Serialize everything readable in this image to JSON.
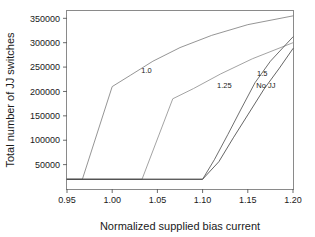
{
  "chart_data": {
    "type": "line",
    "title": "",
    "xlabel": "Normalized supplied bias current",
    "ylabel": "Total number of JJ switches",
    "xlim": [
      0.95,
      1.2
    ],
    "ylim": [
      0,
      365000
    ],
    "xticks": [
      "0.95",
      "1.00",
      "1.05",
      "1.10",
      "1.15",
      "1.20"
    ],
    "xtick_values": [
      0.95,
      1.0,
      1.05,
      1.1,
      1.15,
      1.2
    ],
    "yticks": [
      "50000",
      "100000",
      "150000",
      "200000",
      "250000",
      "300000",
      "350000"
    ],
    "ytick_values": [
      50000,
      100000,
      150000,
      200000,
      250000,
      300000,
      350000
    ],
    "grid": false,
    "legend": "inline-annotations",
    "baseline_value": 20000,
    "series": [
      {
        "name": "1.0",
        "label": "1.0",
        "label_x": 1.038,
        "label_y": 238000,
        "color": "#7a7a7a",
        "x": [
          0.95,
          0.967,
          1.0,
          1.02,
          1.045,
          1.075,
          1.11,
          1.15,
          1.2
        ],
        "y": [
          20000,
          20000,
          210000,
          233000,
          262000,
          290000,
          315000,
          337000,
          355000
        ]
      },
      {
        "name": "1.25",
        "label": "1.25",
        "label_x": 1.124,
        "label_y": 207000,
        "color": "#8c8c8c",
        "x": [
          0.95,
          1.033,
          1.067,
          1.09,
          1.12,
          1.155,
          1.2
        ],
        "y": [
          20000,
          20000,
          185000,
          206000,
          236000,
          267000,
          300000
        ]
      },
      {
        "name": "1.5",
        "label": "1.5",
        "label_x": 1.166,
        "label_y": 232000,
        "color": "#4a4a4a",
        "x": [
          0.95,
          1.1,
          1.113,
          1.128,
          1.142,
          1.158,
          1.175,
          1.2
        ],
        "y": [
          20000,
          20000,
          60000,
          112000,
          162000,
          218000,
          262000,
          312000
        ]
      },
      {
        "name": "No JJ",
        "label": "No JJ",
        "label_x": 1.17,
        "label_y": 207000,
        "color": "#3d3d3d",
        "x": [
          0.95,
          1.1,
          1.118,
          1.134,
          1.15,
          1.168,
          1.185,
          1.2
        ],
        "y": [
          20000,
          20000,
          56000,
          105000,
          152000,
          205000,
          248000,
          288000
        ]
      }
    ]
  },
  "axes": {
    "x_title": "Normalized supplied bias current",
    "y_title": "Total number of JJ switches"
  }
}
